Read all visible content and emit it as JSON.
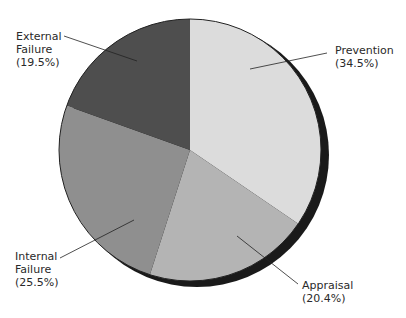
{
  "chart_data": {
    "type": "pie",
    "title": "",
    "categories": [
      "Prevention",
      "Appraisal",
      "Internal Failure",
      "External Failure"
    ],
    "values": [
      34.5,
      20.4,
      25.5,
      19.5
    ],
    "unit": "%",
    "start_angle_deg": 0,
    "direction": "clockwise",
    "style": "3d-shadow",
    "colors": [
      "#dcdcdc",
      "#b4b4b4",
      "#8f8f8f",
      "#4e4e4e"
    ],
    "labels": [
      {
        "line1": "Prevention",
        "line2": "(34.5%)"
      },
      {
        "line1": "Appraisal",
        "line2": "(20.4%)"
      },
      {
        "line1": "Internal",
        "line2": "Failure",
        "line3": "(25.5%)"
      },
      {
        "line1": "External",
        "line2": "Failure",
        "line3": "(19.5%)"
      }
    ],
    "legend": "none (callout labels)"
  }
}
